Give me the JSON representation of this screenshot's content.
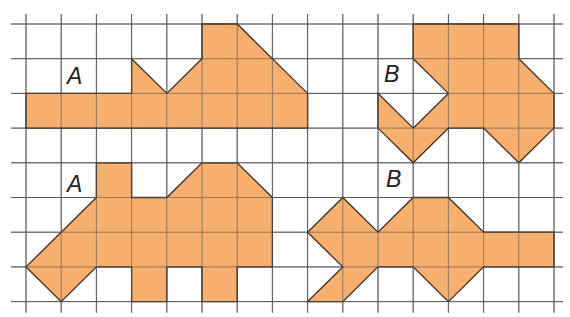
{
  "figure": {
    "grid": {
      "x0": 26,
      "y0": 24,
      "dx": 35.2,
      "dy": 34.7,
      "cols": 15,
      "rows": 8,
      "line_color": "#5a5a5a",
      "extend_left": 15,
      "extend_right": 9,
      "extend_top": 10,
      "extend_bottom": 11
    },
    "fill_color": "#F5A862",
    "outline_color": "#3b2a1c",
    "shapes": [
      {
        "label": "A",
        "name": "shape-a-top",
        "label_pos": [
          76,
          77
        ],
        "points": [
          [
            0,
            2
          ],
          [
            3,
            2
          ],
          [
            3,
            1
          ],
          [
            4,
            2
          ],
          [
            5,
            1
          ],
          [
            5,
            0
          ],
          [
            6,
            0
          ],
          [
            8,
            2
          ],
          [
            8,
            3
          ],
          [
            0,
            3
          ]
        ]
      },
      {
        "label": "B",
        "name": "shape-b-top",
        "label_pos": [
          393,
          75
        ],
        "points": [
          [
            11,
            0
          ],
          [
            14,
            0
          ],
          [
            14,
            1
          ],
          [
            15,
            2
          ],
          [
            15,
            3
          ],
          [
            14,
            4
          ],
          [
            13,
            3
          ],
          [
            12,
            3
          ],
          [
            11,
            4
          ],
          [
            10,
            3
          ],
          [
            10,
            2
          ],
          [
            11,
            3
          ],
          [
            12,
            2
          ],
          [
            11,
            1
          ]
        ]
      },
      {
        "label": "A",
        "name": "shape-a-bottom",
        "label_pos": [
          76,
          185
        ],
        "points": [
          [
            2,
            4
          ],
          [
            3,
            4
          ],
          [
            3,
            5
          ],
          [
            4,
            5
          ],
          [
            5,
            4
          ],
          [
            6,
            4
          ],
          [
            7,
            5
          ],
          [
            7,
            7
          ],
          [
            6,
            7
          ],
          [
            6,
            8
          ],
          [
            5,
            8
          ],
          [
            5,
            7
          ],
          [
            4,
            7
          ],
          [
            4,
            8
          ],
          [
            3,
            8
          ],
          [
            3,
            7
          ],
          [
            2,
            7
          ],
          [
            1,
            8
          ],
          [
            0,
            7
          ],
          [
            2,
            5
          ]
        ]
      },
      {
        "label": "B",
        "name": "shape-b-bottom",
        "label_pos": [
          395,
          180
        ],
        "points": [
          [
            9,
            5
          ],
          [
            10,
            6
          ],
          [
            11,
            5
          ],
          [
            12,
            5
          ],
          [
            13,
            6
          ],
          [
            15,
            6
          ],
          [
            15,
            7
          ],
          [
            13,
            7
          ],
          [
            12,
            8
          ],
          [
            11,
            7
          ],
          [
            10,
            7
          ],
          [
            9,
            8
          ],
          [
            8,
            8
          ],
          [
            9,
            7
          ],
          [
            8,
            6
          ]
        ]
      }
    ]
  }
}
